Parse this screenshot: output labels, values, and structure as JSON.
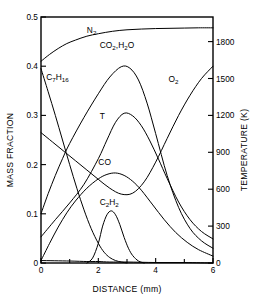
{
  "chart_data": {
    "type": "line",
    "title": "",
    "xlabel": "DISTANCE (mm)",
    "ylabel": "MASS FRACTION",
    "y2label": "TEMPERATURE (K)",
    "xlim": [
      0,
      6
    ],
    "ylim": [
      0,
      0.5
    ],
    "y2lim": [
      0,
      2000
    ],
    "grid": false,
    "legend": "inline-curve-labels",
    "xticks": [
      0,
      2,
      4,
      6
    ],
    "xticklabels": [
      "0",
      "2",
      "4",
      "6"
    ],
    "xminorticks": [
      1,
      3,
      5
    ],
    "yticks": [
      0,
      0.1,
      0.2,
      0.3,
      0.4,
      0.5
    ],
    "yticklabels": [
      "0",
      "0.1",
      "0.2",
      "0.3",
      "0.4",
      "0.5"
    ],
    "y2ticks": [
      0,
      300,
      600,
      900,
      1200,
      1500,
      1800
    ],
    "y2ticklabels": [
      "0",
      "300",
      "600",
      "900",
      "1200",
      "1500",
      "1800"
    ],
    "series": [
      {
        "name": "N2",
        "label": "N₂",
        "label_text": "N2",
        "axis": "left",
        "label_x": 1.6,
        "label_y": 0.468,
        "x": [
          0,
          0.3,
          0.6,
          0.9,
          1.2,
          1.6,
          2.0,
          2.5,
          3.0,
          3.5,
          4.0,
          4.5,
          5.0,
          5.5,
          6.0
        ],
        "y": [
          0.41,
          0.424,
          0.436,
          0.446,
          0.453,
          0.461,
          0.466,
          0.471,
          0.474,
          0.4755,
          0.4765,
          0.477,
          0.4775,
          0.478,
          0.478
        ]
      },
      {
        "name": "C7H16",
        "label": "C₇H₁₆",
        "label_text": "C7H16",
        "axis": "left",
        "label_x": 0.18,
        "label_y": 0.372,
        "x": [
          0,
          0.25,
          0.5,
          0.75,
          1.0,
          1.25,
          1.5,
          1.75,
          2.0,
          2.2,
          2.4,
          2.6,
          2.8,
          3.0
        ],
        "y": [
          0.395,
          0.348,
          0.3,
          0.25,
          0.2,
          0.152,
          0.108,
          0.07,
          0.04,
          0.022,
          0.011,
          0.005,
          0.002,
          0.0
        ]
      },
      {
        "name": "CO2,H2O",
        "label": "CO₂,H₂O",
        "label_text": "CO2,H2O",
        "axis": "left",
        "label_x": 2.05,
        "label_y": 0.438,
        "x": [
          0,
          0.25,
          0.5,
          0.75,
          1.0,
          1.5,
          2.0,
          2.4,
          2.8,
          3.1,
          3.4,
          3.7,
          4.0,
          4.4,
          4.8,
          5.2,
          5.6,
          6.0
        ],
        "y": [
          0.1,
          0.141,
          0.178,
          0.212,
          0.243,
          0.296,
          0.344,
          0.378,
          0.399,
          0.396,
          0.372,
          0.325,
          0.263,
          0.178,
          0.113,
          0.07,
          0.045,
          0.03
        ]
      },
      {
        "name": "T",
        "label": "T",
        "label_text": "T",
        "axis": "right",
        "label_x": 2.05,
        "label_y": 0.292,
        "x": [
          0,
          0.5,
          1.0,
          1.5,
          2.0,
          2.3,
          2.6,
          2.9,
          3.2,
          3.5,
          3.8,
          4.1,
          4.4,
          4.8,
          5.2,
          5.6,
          6.0
        ],
        "y_temperature": [
          265,
          440,
          610,
          800,
          1060,
          1250,
          1430,
          1522,
          1495,
          1395,
          1240,
          1055,
          860,
          620,
          440,
          320,
          245
        ],
        "y": [
          0.0531,
          0.088,
          0.122,
          0.16,
          0.212,
          0.25,
          0.286,
          0.3044,
          0.299,
          0.279,
          0.248,
          0.211,
          0.172,
          0.124,
          0.088,
          0.064,
          0.049
        ]
      },
      {
        "name": "O2",
        "label": "O₂",
        "label_text": "O2",
        "axis": "left",
        "label_x": 4.45,
        "label_y": 0.368,
        "x": [
          0,
          0.4,
          0.8,
          1.2,
          1.6,
          2.0,
          2.4,
          2.8,
          3.2,
          3.6,
          4.0,
          4.4,
          4.8,
          5.2,
          5.6,
          6.0
        ],
        "y": [
          0.265,
          0.246,
          0.227,
          0.208,
          0.189,
          0.17,
          0.152,
          0.14,
          0.142,
          0.165,
          0.205,
          0.253,
          0.3,
          0.341,
          0.375,
          0.4
        ]
      },
      {
        "name": "CO",
        "label": "CO",
        "label_text": "CO",
        "axis": "left",
        "label_x": 2.0,
        "label_y": 0.2,
        "x": [
          0,
          0.3,
          0.6,
          0.9,
          1.2,
          1.6,
          2.0,
          2.3,
          2.6,
          2.9,
          3.2,
          3.5,
          3.9,
          4.3,
          4.7,
          5.1,
          5.5,
          6.0
        ],
        "y": [
          0.005,
          0.04,
          0.073,
          0.102,
          0.126,
          0.152,
          0.171,
          0.18,
          0.183,
          0.178,
          0.166,
          0.148,
          0.118,
          0.088,
          0.062,
          0.042,
          0.027,
          0.014
        ]
      },
      {
        "name": "C2H2",
        "label": "C₂H₂",
        "label_text": "C2H2",
        "axis": "left",
        "label_x": 2.05,
        "label_y": 0.118,
        "x": [
          1.6,
          1.8,
          2.0,
          2.15,
          2.3,
          2.45,
          2.6,
          2.75,
          2.9,
          3.05,
          3.2,
          3.4,
          3.6
        ],
        "y": [
          0.0,
          0.01,
          0.04,
          0.075,
          0.098,
          0.106,
          0.098,
          0.078,
          0.052,
          0.03,
          0.015,
          0.004,
          0.0
        ]
      },
      {
        "name": "baseline-trace",
        "label": "",
        "label_text": "",
        "axis": "left",
        "label_x": 0,
        "label_y": 0,
        "x": [
          0,
          1.0,
          1.6,
          2.0,
          2.4,
          3.0,
          4.0,
          5.0,
          6.0
        ],
        "y": [
          0.005,
          0.004,
          0.003,
          0.003,
          0.002,
          0.002,
          0.001,
          0.001,
          0.0
        ]
      }
    ]
  },
  "axes": {
    "x_title": "DISTANCE (mm)",
    "y_left_title": "MASS FRACTION",
    "y_right_title": "TEMPERATURE (K)"
  }
}
